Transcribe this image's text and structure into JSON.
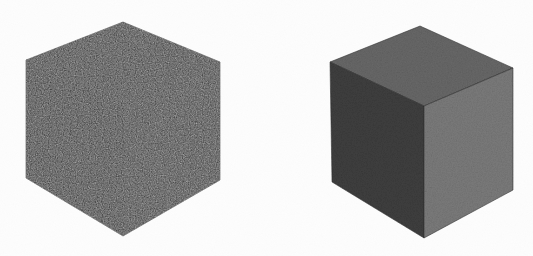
{
  "figure": {
    "name": "two-shaded-cubes-figure",
    "width": 533,
    "height": 256,
    "background_color": "#fdfdfd",
    "texture": "grainy-scan-noise"
  },
  "objects": [
    {
      "id": "cube-left",
      "label": "Left cube",
      "shading": "flat-unlit",
      "outline_color": "#2a2a2a",
      "faces": [
        {
          "id": "left-cube-top-face",
          "name": "top-face",
          "color": "#343434",
          "points": "26,60 123,22 220,62 123,101"
        },
        {
          "id": "left-cube-left-face",
          "name": "left-face",
          "color": "#313131",
          "points": "26,60 123,101 123,236 26,178"
        },
        {
          "id": "left-cube-right-face",
          "name": "right-face",
          "color": "#363636",
          "points": "123,101 220,62 220,180 123,236"
        }
      ]
    },
    {
      "id": "cube-right",
      "label": "Right cube",
      "shading": "directional-lit",
      "outline_color": "#2f2f2f",
      "faces": [
        {
          "id": "right-cube-top-face",
          "name": "top-face",
          "color": "#676767",
          "points": "330,62 420,26 513,68 424,106"
        },
        {
          "id": "right-cube-left-face",
          "name": "left-face",
          "color": "#3d3d3d",
          "points": "330,62 424,106 424,238 332,182"
        },
        {
          "id": "right-cube-right-face",
          "name": "right-face",
          "color": "#7a7a7a",
          "points": "424,106 513,68 513,190 424,238"
        }
      ]
    }
  ],
  "palette": {
    "background": "#fdfdfd",
    "left_cube_tone": "#333333",
    "right_top_tone": "#676767",
    "right_left_tone": "#3d3d3d",
    "right_right_tone": "#7a7a7a"
  }
}
